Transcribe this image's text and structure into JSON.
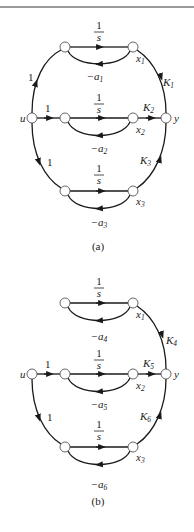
{
  "figures": [
    {
      "caption": "(a)",
      "branches": [
        {
          "integrator": "1/s",
          "state": "x1",
          "feedback": "−a1",
          "input_gain": "1",
          "output_gain": "K1"
        },
        {
          "integrator": "1/s",
          "state": "x2",
          "feedback": "−a2",
          "input_gain": "1",
          "output_gain": "K2"
        },
        {
          "integrator": "1/s",
          "state": "x3",
          "feedback": "−a3",
          "input_gain": "1",
          "output_gain": "K3"
        }
      ],
      "input": "u",
      "output": "y"
    },
    {
      "caption": "(b)",
      "branches": [
        {
          "integrator": "1/s",
          "state": "x1",
          "feedback": "−a4",
          "output_gain": "K4"
        },
        {
          "integrator": "1/s",
          "state": "x2",
          "feedback": "−a5",
          "input_gain": "1",
          "output_gain": "K5"
        },
        {
          "integrator": "1/s",
          "state": "x3",
          "feedback": "−a6",
          "input_gain": "1",
          "output_gain": "K6"
        }
      ],
      "input": "u",
      "output": "y"
    }
  ],
  "colors": {
    "line": "#1a1a1a",
    "node_stroke": "#555555",
    "rule": "#9a9a9a"
  }
}
